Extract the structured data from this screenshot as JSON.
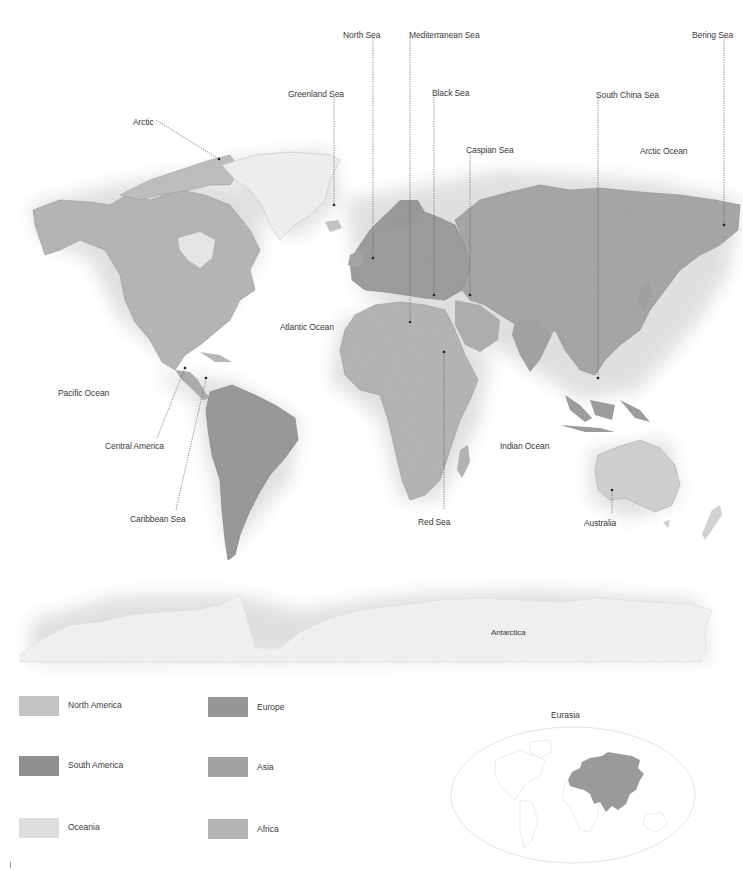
{
  "map": {
    "ocean_labels": [
      {
        "text": "Atlantic Ocean",
        "x": 280,
        "y": 322
      },
      {
        "text": "Pacific Ocean",
        "x": 58,
        "y": 388
      },
      {
        "text": "Indian Ocean",
        "x": 500,
        "y": 441
      },
      {
        "text": "Arctic Ocean",
        "x": 640,
        "y": 146
      }
    ],
    "leader_labels": [
      {
        "text": "North Sea",
        "x": 343,
        "y": 30
      },
      {
        "text": "Mediterranean Sea",
        "x": 409,
        "y": 30
      },
      {
        "text": "Bering Sea",
        "x": 692,
        "y": 30
      },
      {
        "text": "Greenland Sea",
        "x": 288,
        "y": 89
      },
      {
        "text": "Black Sea",
        "x": 432,
        "y": 88
      },
      {
        "text": "South China Sea",
        "x": 596,
        "y": 90
      },
      {
        "text": "Arctic",
        "x": 133,
        "y": 117
      },
      {
        "text": "Caspian Sea",
        "x": 466,
        "y": 145
      },
      {
        "text": "Central America",
        "x": 105,
        "y": 441
      },
      {
        "text": "Caribbean Sea",
        "x": 130,
        "y": 514
      },
      {
        "text": "Red Sea",
        "x": 418,
        "y": 517
      },
      {
        "text": "Australia",
        "x": 584,
        "y": 518
      },
      {
        "text": "Antarctica",
        "x": 491,
        "y": 628
      }
    ]
  },
  "legend": {
    "items": [
      {
        "label": "North America",
        "color": "#c4c4c4"
      },
      {
        "label": "Europe",
        "color": "#969696"
      },
      {
        "label": "South America",
        "color": "#8e8e8e"
      },
      {
        "label": "Asia",
        "color": "#a2a2a2"
      },
      {
        "label": "Oceania",
        "color": "#dedede"
      },
      {
        "label": "Africa",
        "color": "#b4b4b4"
      }
    ]
  },
  "inset": {
    "title": "Eurasia",
    "highlight_color": "#9a9a9a"
  }
}
